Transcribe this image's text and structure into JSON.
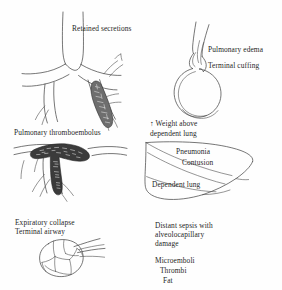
{
  "figure": {
    "style": "pen-and-ink line drawing",
    "ink_color": "#4a4a4a",
    "background_color": "#fefefe"
  },
  "panels": {
    "retained_secretions": {
      "label": "Retained secretions",
      "subject": "bronchial-tree-with-mucus-plug"
    },
    "pulmonary_edema": {
      "label_1": "Pulmonary edema",
      "label_2": "Terminal cuffing",
      "subject": "alveolus-with-peribronchial-cuffing"
    },
    "thromboembolus": {
      "label": "Pulmonary thromboembolus",
      "subject": "saddle-embolus-in-branching-vessel"
    },
    "dependent_lung": {
      "label_weight": "↑ Weight above",
      "label_weight_2": "dependent lung",
      "label_pneumonia": "Pneumonia",
      "label_contusion": "Contusion",
      "label_dependent": "Dependent lung",
      "subject": "lung-cross-section-wedge"
    },
    "expiratory_collapse": {
      "label_1": "Expiratory collapse",
      "label_2": "Terminal airway",
      "subject": "alveolar-cluster-with-airway"
    },
    "distant_sepsis": {
      "label_1": "Distant sepsis with",
      "label_2": "alveolocapillary",
      "label_3": "damage",
      "list_1": "Microemboli",
      "list_2": "Thrombi",
      "list_3": "Fat"
    }
  }
}
